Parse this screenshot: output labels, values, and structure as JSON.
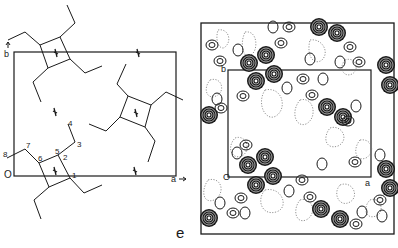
{
  "figure": {
    "panel_label": "e",
    "colors": {
      "ink": "#1a1a1a",
      "background": "#ffffff",
      "dotted_contour": "#777777"
    },
    "left_panel": {
      "title": "molecular packing projection",
      "axes": {
        "origin": "O",
        "a_axis": "a",
        "b_axis": "b"
      },
      "atom_labels": [
        "1",
        "2",
        "3",
        "4",
        "5",
        "6",
        "7",
        "8"
      ],
      "symmetry_marker": "two-fold screw axis symbol"
    },
    "right_panel": {
      "title": "electron density / Patterson contour map",
      "axes": {
        "origin": "O",
        "a_axis": "a",
        "b_axis": "b"
      },
      "contour_types": [
        "solid positive contours",
        "dotted negative contours",
        "dense dark peaks"
      ]
    }
  }
}
